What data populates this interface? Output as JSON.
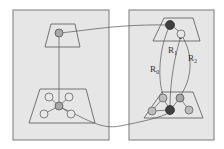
{
  "diagram": {
    "type": "graph-mapping",
    "panels": [
      {
        "id": "left-panel",
        "x": 13,
        "y": 10,
        "w": 96,
        "h": 130
      },
      {
        "id": "right-panel",
        "x": 129,
        "y": 10,
        "w": 85,
        "h": 130
      }
    ],
    "labels": {
      "r0": {
        "base": "R",
        "sub": "0"
      },
      "r1": {
        "base": "R",
        "sub": "1"
      },
      "r2": {
        "base": "R",
        "sub": "2"
      }
    },
    "colors": {
      "panel_fill": "#e6e6e6",
      "panel_stroke": "#7a7a7a",
      "dark_node": "#404040",
      "light_node": "#bdbdbd",
      "empty_node": "#e8e8e8"
    }
  }
}
